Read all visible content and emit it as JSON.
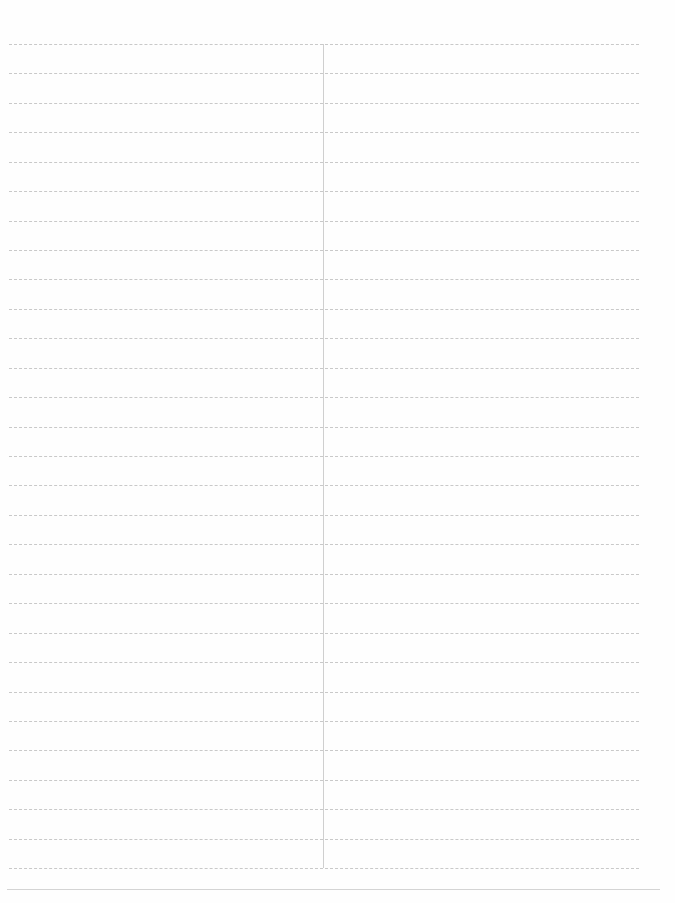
{
  "document": {
    "type": "blank ruled sheet",
    "columns": 2,
    "rows": 28,
    "line_color": "#c9c9c9",
    "cells": []
  }
}
